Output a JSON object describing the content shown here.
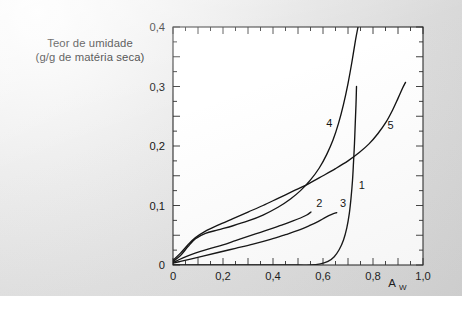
{
  "figure": {
    "background_color": "#e2e2e2",
    "plot_background_color": "#ffffff",
    "line_color": "#101010"
  },
  "chart_data": {
    "type": "line",
    "title": "",
    "subtitle": "",
    "xlabel": "A",
    "xlabel_subscript": "W",
    "ylabel_line1": "Teor de umidade",
    "ylabel_line2": "(g/g de matéria seca)",
    "xlim": [
      0,
      1.0
    ],
    "ylim": [
      0,
      0.4
    ],
    "grid": false,
    "legend_position": "inline-curve-labels",
    "decimal_separator": ",",
    "xticks": [
      0,
      0.1,
      0.2,
      0.3,
      0.4,
      0.5,
      0.6,
      0.7,
      0.8,
      0.9,
      1.0
    ],
    "xticklabels": [
      "0",
      "",
      "0,2",
      "",
      "0,4",
      "",
      "0,6",
      "",
      "0,8",
      "",
      "1,0"
    ],
    "yticks": [
      0,
      0.05,
      0.1,
      0.15,
      0.2,
      0.25,
      0.3,
      0.35,
      0.4
    ],
    "yticklabels": [
      "0",
      "",
      "0,1",
      "",
      "0,2",
      "",
      "0,3",
      "",
      "0,4"
    ],
    "xtick_minor_step": 0.05,
    "ytick_minor_step": 0.025,
    "series": [
      {
        "name": "1",
        "label": "1",
        "label_x": 0.755,
        "label_y": 0.128,
        "points": [
          [
            0.0,
            0.0
          ],
          [
            0.1,
            0.0
          ],
          [
            0.2,
            0.0
          ],
          [
            0.3,
            0.0
          ],
          [
            0.4,
            0.0
          ],
          [
            0.5,
            0.0
          ],
          [
            0.55,
            0.0
          ],
          [
            0.59,
            0.002
          ],
          [
            0.62,
            0.006
          ],
          [
            0.645,
            0.014
          ],
          [
            0.665,
            0.026
          ],
          [
            0.682,
            0.042
          ],
          [
            0.695,
            0.062
          ],
          [
            0.705,
            0.086
          ],
          [
            0.712,
            0.112
          ],
          [
            0.718,
            0.142
          ],
          [
            0.722,
            0.172
          ],
          [
            0.726,
            0.205
          ],
          [
            0.729,
            0.238
          ],
          [
            0.732,
            0.27
          ],
          [
            0.734,
            0.3
          ]
        ]
      },
      {
        "name": "2",
        "label": "2",
        "label_x": 0.585,
        "label_y": 0.098,
        "points": [
          [
            0.0,
            0.004
          ],
          [
            0.02,
            0.008
          ],
          [
            0.045,
            0.013
          ],
          [
            0.075,
            0.018
          ],
          [
            0.11,
            0.023
          ],
          [
            0.15,
            0.028
          ],
          [
            0.2,
            0.034
          ],
          [
            0.25,
            0.041
          ],
          [
            0.3,
            0.048
          ],
          [
            0.35,
            0.055
          ],
          [
            0.4,
            0.062
          ],
          [
            0.44,
            0.068
          ],
          [
            0.48,
            0.074
          ],
          [
            0.51,
            0.079
          ],
          [
            0.535,
            0.084
          ],
          [
            0.552,
            0.089
          ]
        ]
      },
      {
        "name": "3",
        "label": "3",
        "label_x": 0.68,
        "label_y": 0.098,
        "points": [
          [
            0.0,
            0.003
          ],
          [
            0.03,
            0.006
          ],
          [
            0.07,
            0.01
          ],
          [
            0.12,
            0.015
          ],
          [
            0.18,
            0.021
          ],
          [
            0.25,
            0.028
          ],
          [
            0.32,
            0.035
          ],
          [
            0.39,
            0.043
          ],
          [
            0.45,
            0.051
          ],
          [
            0.5,
            0.058
          ],
          [
            0.545,
            0.066
          ],
          [
            0.58,
            0.073
          ],
          [
            0.61,
            0.08
          ],
          [
            0.635,
            0.085
          ],
          [
            0.655,
            0.088
          ]
        ]
      },
      {
        "name": "4",
        "label": "4",
        "label_x": 0.625,
        "label_y": 0.232,
        "points": [
          [
            0.0,
            0.006
          ],
          [
            0.03,
            0.016
          ],
          [
            0.06,
            0.031
          ],
          [
            0.09,
            0.044
          ],
          [
            0.13,
            0.053
          ],
          [
            0.18,
            0.059
          ],
          [
            0.24,
            0.066
          ],
          [
            0.3,
            0.074
          ],
          [
            0.36,
            0.084
          ],
          [
            0.42,
            0.097
          ],
          [
            0.47,
            0.111
          ],
          [
            0.51,
            0.125
          ],
          [
            0.55,
            0.143
          ],
          [
            0.585,
            0.163
          ],
          [
            0.615,
            0.186
          ],
          [
            0.64,
            0.21
          ],
          [
            0.662,
            0.238
          ],
          [
            0.682,
            0.27
          ],
          [
            0.7,
            0.305
          ],
          [
            0.716,
            0.342
          ],
          [
            0.73,
            0.378
          ],
          [
            0.74,
            0.4
          ]
        ]
      },
      {
        "name": "5",
        "label": "5",
        "label_x": 0.87,
        "label_y": 0.228,
        "points": [
          [
            0.0,
            0.008
          ],
          [
            0.03,
            0.02
          ],
          [
            0.06,
            0.034
          ],
          [
            0.09,
            0.046
          ],
          [
            0.13,
            0.057
          ],
          [
            0.18,
            0.067
          ],
          [
            0.24,
            0.078
          ],
          [
            0.3,
            0.089
          ],
          [
            0.36,
            0.1
          ],
          [
            0.42,
            0.112
          ],
          [
            0.48,
            0.124
          ],
          [
            0.54,
            0.136
          ],
          [
            0.6,
            0.15
          ],
          [
            0.65,
            0.162
          ],
          [
            0.7,
            0.175
          ],
          [
            0.745,
            0.189
          ],
          [
            0.785,
            0.204
          ],
          [
            0.82,
            0.221
          ],
          [
            0.852,
            0.24
          ],
          [
            0.878,
            0.26
          ],
          [
            0.9,
            0.28
          ],
          [
            0.918,
            0.297
          ],
          [
            0.93,
            0.307
          ]
        ]
      }
    ]
  }
}
